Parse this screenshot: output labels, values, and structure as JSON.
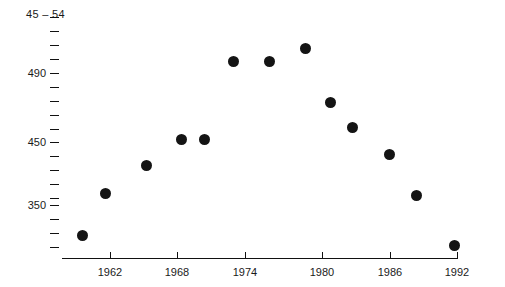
{
  "chart_data": {
    "type": "scatter",
    "title": "45 – 54",
    "xlabel": "",
    "ylabel": "",
    "grid": false,
    "legend": null,
    "xlim": [
      1958.5,
      1992
    ],
    "ylim": [
      310,
      545
    ],
    "x_ticks": [
      1962,
      1968,
      1974,
      1980,
      1986,
      1992
    ],
    "x_tick_labels": [
      "1962",
      "1968",
      "1974",
      "1980",
      "1986",
      "1992"
    ],
    "y_ticks": [
      530,
      510,
      490,
      470,
      450,
      430,
      410,
      390,
      370,
      350,
      330,
      320
    ],
    "y_tick_labels": [
      "",
      "",
      "490",
      "",
      "450",
      "",
      "",
      "",
      "",
      "350",
      "",
      ""
    ],
    "y_labeled_values": [
      490,
      450,
      350
    ],
    "point_color": "#141414",
    "points": [
      {
        "x": 1960,
        "y": 328
      },
      {
        "x": 1962,
        "y": 395
      },
      {
        "x": 1966,
        "y": 418
      },
      {
        "x": 1968,
        "y": 450
      },
      {
        "x": 1970,
        "y": 450
      },
      {
        "x": 1973,
        "y": 508
      },
      {
        "x": 1976,
        "y": 508
      },
      {
        "x": 1979,
        "y": 522
      },
      {
        "x": 1981,
        "y": 472
      },
      {
        "x": 1983,
        "y": 460
      },
      {
        "x": 1986,
        "y": 438
      },
      {
        "x": 1988,
        "y": 368
      },
      {
        "x": 1991,
        "y": 315
      }
    ]
  },
  "axis_pixels": {
    "y_tick_y": [
      17,
      31,
      45,
      59,
      73,
      87,
      101,
      115,
      129,
      142,
      156,
      170,
      184,
      198,
      205,
      219,
      233,
      247
    ],
    "y_label_positions": [
      {
        "label": "490",
        "top": 67
      },
      {
        "label": "450",
        "top": 136
      },
      {
        "label": "350",
        "top": 199
      }
    ],
    "x_axis_left": 62,
    "x_axis_right": 458,
    "x_axis_top": 258,
    "x_tick_x": [
      110,
      177,
      245,
      322,
      390,
      457
    ],
    "point_pixels": [
      {
        "cx": 82,
        "cy": 235
      },
      {
        "cx": 105,
        "cy": 193
      },
      {
        "cx": 146,
        "cy": 165
      },
      {
        "cx": 181,
        "cy": 139
      },
      {
        "cx": 204,
        "cy": 139
      },
      {
        "cx": 233,
        "cy": 61
      },
      {
        "cx": 269,
        "cy": 61
      },
      {
        "cx": 305,
        "cy": 48
      },
      {
        "cx": 330,
        "cy": 102
      },
      {
        "cx": 352,
        "cy": 127
      },
      {
        "cx": 389,
        "cy": 154
      },
      {
        "cx": 416,
        "cy": 195
      },
      {
        "cx": 454,
        "cy": 245
      }
    ]
  }
}
